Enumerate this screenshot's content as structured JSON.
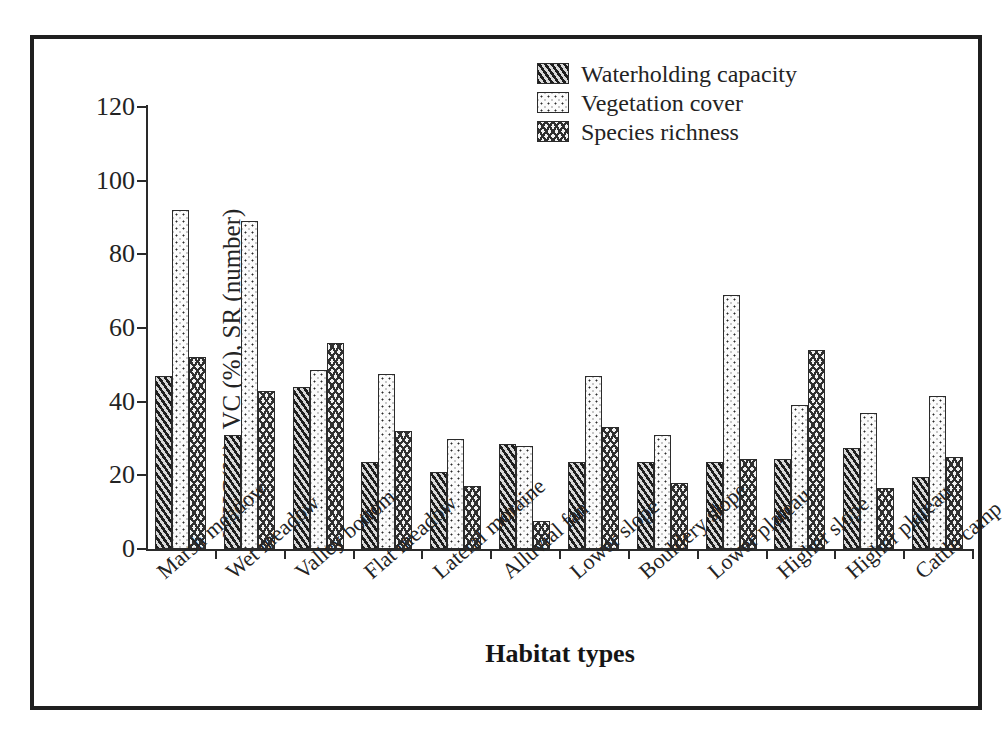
{
  "chart_data": {
    "type": "bar",
    "title": "",
    "xlabel": "Habitat types",
    "ylabel": "WHC(%), VC (%), SR (number)",
    "ylim": [
      0,
      120
    ],
    "yticks": [
      0,
      20,
      40,
      60,
      80,
      100,
      120
    ],
    "grid": false,
    "legend_position": "top-right",
    "categories": [
      "Marsh meadow",
      "Wet meadow",
      "Valley bottom",
      "Flat meadow",
      "Lateral moraine",
      "Alluvial fan",
      "Lower slope",
      "Bouldery slope",
      "Lower plateau",
      "Higher slope",
      "Higher plateau",
      "Cattle camp"
    ],
    "series": [
      {
        "name": "Waterholding capacity",
        "pattern": "diagonal-hatch",
        "values": [
          47,
          31,
          44,
          23.5,
          21,
          28.5,
          23.5,
          23.5,
          23.5,
          24.5,
          27.5,
          19.5
        ]
      },
      {
        "name": "Vegetation cover",
        "pattern": "dotted",
        "values": [
          92,
          89,
          48.5,
          47.5,
          30,
          28,
          47,
          31,
          69,
          39,
          37,
          41.5
        ]
      },
      {
        "name": "Species richness",
        "pattern": "crosshatch",
        "values": [
          52,
          43,
          56,
          32,
          17,
          7.5,
          33,
          18,
          24.5,
          54,
          16.5,
          25
        ]
      }
    ]
  },
  "legend": {
    "items": [
      {
        "label": "Waterholding capacity"
      },
      {
        "label": "Vegetation cover"
      },
      {
        "label": "Species richness"
      }
    ]
  },
  "axes": {
    "y_title": "WHC(%), VC (%), SR (number)",
    "x_title": "Habitat types",
    "y_tick_labels": [
      "0",
      "20",
      "40",
      "60",
      "80",
      "100",
      "120"
    ]
  },
  "colors": {
    "frame": "#1f1f1f",
    "axis": "#2a2a2a",
    "text": "#232323",
    "bar_outline": "#2b2b2b"
  }
}
